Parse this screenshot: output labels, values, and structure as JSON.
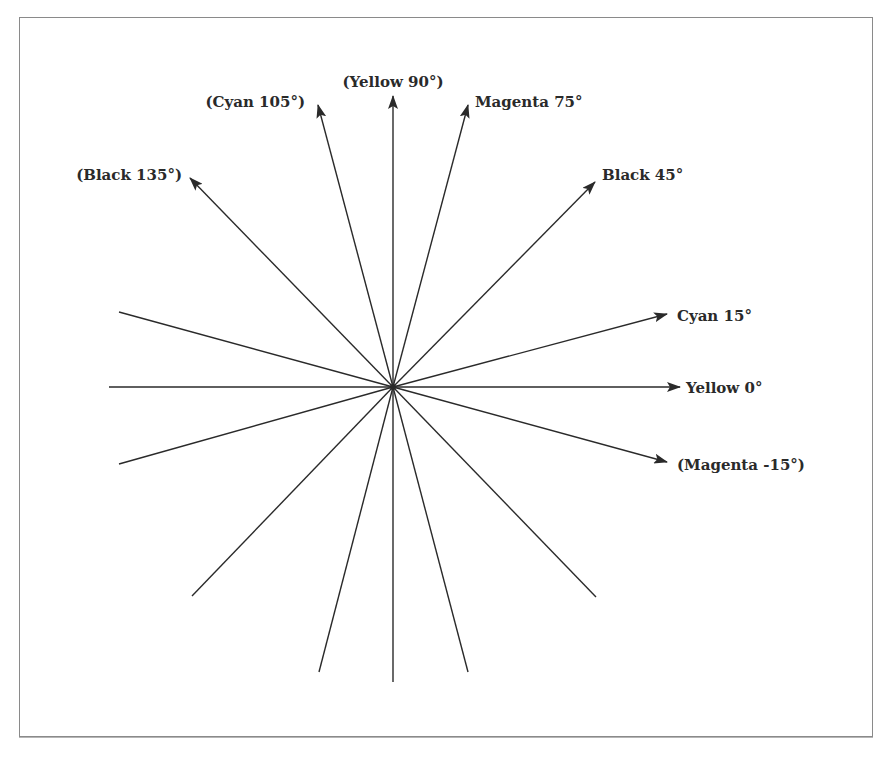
{
  "diagram": {
    "type": "screen-angle-diagram",
    "center": {
      "x": 393,
      "y": 387
    },
    "line_color": "#2a2a2a",
    "frame_color": "#8a8a8a",
    "arrows": [
      {
        "id": "yellow-0",
        "label": "Yellow 0°",
        "angle": 0,
        "tip": [
          680,
          387
        ],
        "label_pos": [
          686,
          393
        ],
        "anchor": "start"
      },
      {
        "id": "cyan-15",
        "label": "Cyan 15°",
        "angle": 15,
        "tip": [
          667,
          314
        ],
        "label_pos": [
          677,
          321
        ],
        "anchor": "start"
      },
      {
        "id": "black-45",
        "label": "Black 45°",
        "angle": 45,
        "tip": [
          595,
          182
        ],
        "label_pos": [
          602,
          180
        ],
        "anchor": "start"
      },
      {
        "id": "magenta-75",
        "label": "Magenta 75°",
        "angle": 75,
        "tip": [
          468,
          105
        ],
        "label_pos": [
          475,
          107
        ],
        "anchor": "start"
      },
      {
        "id": "yellow-90",
        "label": "(Yellow 90°)",
        "angle": 90,
        "tip": [
          393,
          96
        ],
        "label_pos": [
          393,
          87
        ],
        "anchor": "middle"
      },
      {
        "id": "cyan-105",
        "label": "(Cyan 105°)",
        "angle": 105,
        "tip": [
          318,
          105
        ],
        "label_pos": [
          305,
          107
        ],
        "anchor": "end"
      },
      {
        "id": "black-135",
        "label": "(Black 135°)",
        "angle": 135,
        "tip": [
          190,
          178
        ],
        "label_pos": [
          182,
          180
        ],
        "anchor": "end"
      },
      {
        "id": "magenta-neg15",
        "label": "(Magenta -15°)",
        "angle": -15,
        "tip": [
          667,
          462
        ],
        "label_pos": [
          677,
          470
        ],
        "anchor": "start"
      }
    ],
    "plain_lines": [
      {
        "angle": 150,
        "end": [
          119,
          312
        ]
      },
      {
        "angle": 180,
        "end": [
          109,
          387
        ]
      },
      {
        "angle": 210,
        "end": [
          119,
          464
        ]
      },
      {
        "angle": 225,
        "end": [
          192,
          596
        ]
      },
      {
        "angle": 255,
        "end": [
          319,
          672
        ]
      },
      {
        "angle": 270,
        "end": [
          393,
          682
        ]
      },
      {
        "angle": 285,
        "end": [
          468,
          672
        ]
      },
      {
        "angle": 315,
        "end": [
          596,
          597
        ]
      }
    ]
  }
}
